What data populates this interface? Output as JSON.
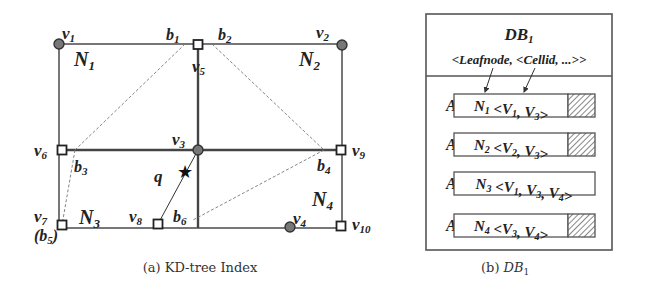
{
  "figure_a": {
    "caption": "(a) KD-tree Index",
    "vertices": [
      {
        "id": "v1",
        "label": "v",
        "sub": "1",
        "marker": "circle"
      },
      {
        "id": "v2",
        "label": "v",
        "sub": "2",
        "marker": "circle"
      },
      {
        "id": "v3",
        "label": "v",
        "sub": "3",
        "marker": "circle"
      },
      {
        "id": "v4",
        "label": "v",
        "sub": "4",
        "marker": "circle"
      },
      {
        "id": "v5",
        "label": "v",
        "sub": "5",
        "marker": "square"
      },
      {
        "id": "v6",
        "label": "v",
        "sub": "6",
        "marker": "square"
      },
      {
        "id": "v7",
        "label": "v",
        "sub": "7",
        "marker": "square"
      },
      {
        "id": "v8",
        "label": "v",
        "sub": "8",
        "marker": "square"
      },
      {
        "id": "v9",
        "label": "v",
        "sub": "9",
        "marker": "square"
      },
      {
        "id": "v10",
        "label": "v",
        "sub": "10",
        "marker": "square"
      }
    ],
    "boundary_points": [
      {
        "id": "b1",
        "label": "b",
        "sub": "1"
      },
      {
        "id": "b2",
        "label": "b",
        "sub": "2"
      },
      {
        "id": "b3",
        "label": "b",
        "sub": "3"
      },
      {
        "id": "b4",
        "label": "b",
        "sub": "4"
      },
      {
        "id": "b5",
        "label": "(b",
        "sub": "5",
        "close": ")"
      },
      {
        "id": "b6",
        "label": "b",
        "sub": "6"
      }
    ],
    "nodes": [
      {
        "id": "N1",
        "label": "N",
        "sub": "1"
      },
      {
        "id": "N2",
        "label": "N",
        "sub": "2"
      },
      {
        "id": "N3",
        "label": "N",
        "sub": "3"
      },
      {
        "id": "N4",
        "label": "N",
        "sub": "4"
      }
    ],
    "query": {
      "label": "q",
      "glyph": "★"
    }
  },
  "figure_b": {
    "caption_prefix": "(b) ",
    "caption_main": "DB",
    "caption_sub": "1",
    "title_main": "DB",
    "title_sub": "1",
    "schema": "<Leafnode, <Cellid, ...>>",
    "entries": [
      {
        "key": "A",
        "key_sub": "1",
        "node": "N",
        "node_sub": "1",
        "open": " <",
        "cells": [
          {
            "v": "V",
            "s": "1"
          },
          {
            "v": "V",
            "s": "3"
          }
        ],
        "close": ">",
        "hatched": true
      },
      {
        "key": "A",
        "key_sub": "2",
        "node": "N",
        "node_sub": "2",
        "open": " <",
        "cells": [
          {
            "v": "V",
            "s": "2"
          },
          {
            "v": "V",
            "s": "3"
          }
        ],
        "close": ">",
        "hatched": true
      },
      {
        "key": "A",
        "key_sub": "3",
        "node": "N",
        "node_sub": "3",
        "open": " <",
        "cells": [
          {
            "v": "V",
            "s": "1"
          },
          {
            "v": "V",
            "s": "3"
          },
          {
            "v": "V",
            "s": "4"
          }
        ],
        "close": ">",
        "hatched": false
      },
      {
        "key": "A",
        "key_sub": "4",
        "node": "N",
        "node_sub": "4",
        "open": " <",
        "cells": [
          {
            "v": "V",
            "s": "3"
          },
          {
            "v": "V",
            "s": "4"
          }
        ],
        "close": ">",
        "hatched": true
      }
    ]
  }
}
